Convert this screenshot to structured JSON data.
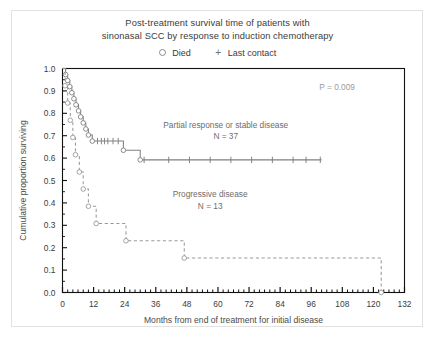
{
  "figure": {
    "title_line1": "Post-treatment survival time of patients with",
    "title_line2": "sinonasal SCC by response to induction chemotherapy",
    "pvalue_label": "P = 0.009"
  },
  "legend": {
    "items": [
      {
        "marker": "open-circle",
        "label": "Died"
      },
      {
        "marker": "plus",
        "label": "Last contact"
      }
    ]
  },
  "chart_data": {
    "type": "line",
    "title": "Post-treatment survival time of patients with sinonasal SCC by response to induction chemotherapy",
    "xlabel": "Months from end of treatment for initial disease",
    "ylabel": "Cumulative proportion surviving",
    "xlim": [
      0,
      132
    ],
    "ylim": [
      0.0,
      1.0
    ],
    "xticks": [
      0,
      12,
      24,
      36,
      48,
      60,
      72,
      84,
      96,
      108,
      120,
      132
    ],
    "xtick_labels": [
      "0",
      "12",
      "24",
      "36",
      "48",
      "60",
      "72",
      "84",
      "96",
      "108",
      "120",
      "132"
    ],
    "yticks": [
      0.0,
      0.1,
      0.2,
      0.3,
      0.4,
      0.5,
      0.6,
      0.7,
      0.8,
      0.9,
      1.0
    ],
    "ytick_labels": [
      "0.0",
      "0.1",
      "0.2",
      "0.3",
      "0.4",
      "0.5",
      "0.6",
      "0.7",
      "0.8",
      "0.9",
      "1.0"
    ],
    "x_minor_tick_interval": 2,
    "grid": false,
    "legend_position": "top-center",
    "annotations": [
      {
        "text": "P = 0.009",
        "x": 106,
        "y": 0.905
      },
      {
        "text": "Partial response or stable disease",
        "x": 63,
        "y": 0.735
      },
      {
        "text": "N = 37",
        "x": 63,
        "y": 0.685
      },
      {
        "text": "Progressive disease",
        "x": 57,
        "y": 0.425
      },
      {
        "text": "N = 13",
        "x": 57,
        "y": 0.375
      }
    ],
    "series": [
      {
        "name": "Partial response or stable disease",
        "n": 37,
        "label": "Partial response or stable disease",
        "line_style": "solid",
        "color": "#808080",
        "steps": [
          [
            0,
            1.0
          ],
          [
            1.2,
            1.0
          ],
          [
            1.2,
            0.973
          ],
          [
            2.0,
            0.973
          ],
          [
            2.0,
            0.946
          ],
          [
            2.8,
            0.946
          ],
          [
            2.8,
            0.919
          ],
          [
            3.6,
            0.919
          ],
          [
            3.6,
            0.892
          ],
          [
            4.4,
            0.892
          ],
          [
            4.4,
            0.865
          ],
          [
            5.2,
            0.865
          ],
          [
            5.2,
            0.838
          ],
          [
            6.2,
            0.838
          ],
          [
            6.2,
            0.811
          ],
          [
            7.0,
            0.811
          ],
          [
            7.0,
            0.784
          ],
          [
            8.0,
            0.784
          ],
          [
            8.0,
            0.757
          ],
          [
            9.0,
            0.757
          ],
          [
            9.0,
            0.73
          ],
          [
            10.0,
            0.73
          ],
          [
            10.0,
            0.703
          ],
          [
            11.5,
            0.703
          ],
          [
            11.5,
            0.676
          ],
          [
            23.5,
            0.676
          ],
          [
            23.5,
            0.635
          ],
          [
            30.0,
            0.635
          ],
          [
            30.0,
            0.592
          ],
          [
            100.0,
            0.592
          ]
        ],
        "death_points": [
          [
            1.2,
            0.973
          ],
          [
            2.0,
            0.946
          ],
          [
            2.8,
            0.919
          ],
          [
            3.6,
            0.892
          ],
          [
            4.4,
            0.865
          ],
          [
            5.2,
            0.838
          ],
          [
            6.2,
            0.811
          ],
          [
            7.0,
            0.784
          ],
          [
            8.0,
            0.757
          ],
          [
            9.0,
            0.73
          ],
          [
            10.0,
            0.703
          ],
          [
            11.5,
            0.676
          ],
          [
            23.5,
            0.635
          ],
          [
            30.0,
            0.592
          ]
        ],
        "censor_points": [
          [
            13.5,
            0.676
          ],
          [
            15.0,
            0.676
          ],
          [
            16.2,
            0.676
          ],
          [
            17.5,
            0.676
          ],
          [
            19.5,
            0.676
          ],
          [
            21.5,
            0.676
          ],
          [
            31.5,
            0.592
          ],
          [
            41.0,
            0.592
          ],
          [
            49.0,
            0.592
          ],
          [
            57.0,
            0.592
          ],
          [
            65.0,
            0.592
          ],
          [
            73.0,
            0.592
          ],
          [
            81.0,
            0.592
          ],
          [
            89.0,
            0.592
          ],
          [
            94.0,
            0.592
          ],
          [
            99.5,
            0.592
          ]
        ]
      },
      {
        "name": "Progressive disease",
        "n": 13,
        "label": "Progressive disease",
        "line_style": "dashed",
        "color": "#9a9a9a",
        "steps": [
          [
            0,
            1.0
          ],
          [
            1.0,
            1.0
          ],
          [
            1.0,
            0.923
          ],
          [
            2.0,
            0.923
          ],
          [
            2.0,
            0.846
          ],
          [
            3.0,
            0.846
          ],
          [
            3.0,
            0.769
          ],
          [
            4.0,
            0.769
          ],
          [
            4.0,
            0.692
          ],
          [
            5.0,
            0.692
          ],
          [
            5.0,
            0.615
          ],
          [
            6.5,
            0.615
          ],
          [
            6.5,
            0.538
          ],
          [
            8.0,
            0.538
          ],
          [
            8.0,
            0.462
          ],
          [
            10.0,
            0.462
          ],
          [
            10.0,
            0.385
          ],
          [
            13.0,
            0.385
          ],
          [
            13.0,
            0.308
          ],
          [
            24.5,
            0.308
          ],
          [
            24.5,
            0.231
          ],
          [
            47.0,
            0.231
          ],
          [
            47.0,
            0.154
          ],
          [
            123.0,
            0.154
          ],
          [
            123.0,
            0.0
          ]
        ],
        "death_points": [
          [
            1.0,
            0.923
          ],
          [
            2.0,
            0.846
          ],
          [
            3.0,
            0.769
          ],
          [
            4.0,
            0.692
          ],
          [
            5.0,
            0.615
          ],
          [
            6.5,
            0.538
          ],
          [
            8.0,
            0.462
          ],
          [
            10.0,
            0.385
          ],
          [
            13.0,
            0.308
          ],
          [
            24.5,
            0.231
          ],
          [
            47.0,
            0.154
          ],
          [
            123.0,
            0.0
          ]
        ],
        "censor_points": []
      }
    ]
  }
}
